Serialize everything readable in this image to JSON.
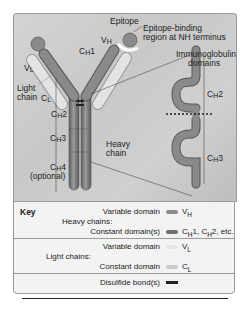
{
  "diagram": {
    "labels": {
      "epitope": "Epitope",
      "epitope_binding": "Epitope-binding",
      "epitope_binding_2": "region at NH terminus",
      "vh": "V",
      "vh_sub": "H",
      "ch1": "C",
      "ch1_sub": "H",
      "ch1_num": "1",
      "vl": "V",
      "vl_sub": "L",
      "light_chain_1": "Light",
      "light_chain_2": "chain",
      "cl": "C",
      "cl_sub": "L",
      "ch2": "C",
      "ch2_sub": "H",
      "ch2_num": "2",
      "ch3": "C",
      "ch3_sub": "H",
      "ch3_num": "3",
      "ch4": "C",
      "ch4_sub": "H",
      "ch4_num": "4",
      "optional": "(optional)",
      "heavy_chain_1": "Heavy",
      "heavy_chain_2": "chain",
      "ig_domains_1": "Immunoglobulin",
      "ig_domains_2": "domains",
      "inset_ch2": "C",
      "inset_ch2_sub": "H",
      "inset_ch2_num": "2",
      "inset_ch3": "C",
      "inset_ch3_sub": "H",
      "inset_ch3_num": "3"
    },
    "colors": {
      "heavy_variable": "#8a8a8a",
      "heavy_constant": "#777777",
      "light_variable": "#e6e6e6",
      "light_constant": "#c9c9c9",
      "disulfide": "#222222",
      "background": "#cfcfcf"
    }
  },
  "key": {
    "title": "Key",
    "heavy_chains_label": "Heavy chains:",
    "light_chains_label": "Light chains:",
    "rows": [
      {
        "label": "Variable domain",
        "symbol": "V",
        "sub": "H",
        "suffix": ""
      },
      {
        "label": "Constant domain(s)",
        "symbol": "C",
        "sub": "H",
        "suffix": "1, C",
        "sub2": "H",
        "suffix2": "2, etc."
      },
      {
        "label": "Variable domain",
        "symbol": "V",
        "sub": "L",
        "suffix": ""
      },
      {
        "label": "Constant domain",
        "symbol": "C",
        "sub": "L",
        "suffix": ""
      },
      {
        "label": "Disulfide bond(s)",
        "symbol": "",
        "sub": "",
        "suffix": ""
      }
    ]
  }
}
